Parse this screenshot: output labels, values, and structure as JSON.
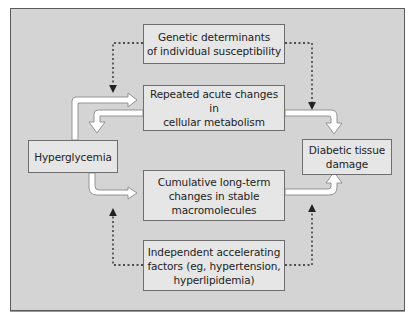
{
  "diagram": {
    "nodes": {
      "genetic": "Genetic determinants\nof individual susceptibility",
      "acute": "Repeated acute changes in\ncellular metabolism",
      "hyperglycemia": "Hyperglycemia",
      "damage": "Diabetic tissue\ndamage",
      "cumulative": "Cumulative long-term\nchanges in stable\nmacromolecules",
      "independent": "Independent accelerating\nfactors (eg, hypertension,\nhyperlipidemia)"
    },
    "edges": [
      {
        "from": "hyperglycemia",
        "to": "acute",
        "style": "hollow-arrow"
      },
      {
        "from": "acute",
        "to": "hyperglycemia",
        "style": "hollow-arrow"
      },
      {
        "from": "acute",
        "to": "damage",
        "style": "hollow-arrow"
      },
      {
        "from": "hyperglycemia",
        "to": "cumulative",
        "style": "hollow-arrow"
      },
      {
        "from": "cumulative",
        "to": "damage",
        "style": "hollow-arrow"
      },
      {
        "from": "genetic",
        "to": "acute",
        "style": "dotted"
      },
      {
        "from": "genetic",
        "to": "damage",
        "style": "dotted"
      },
      {
        "from": "independent",
        "to": "cumulative",
        "style": "dotted"
      },
      {
        "from": "independent",
        "to": "damage",
        "style": "dotted"
      }
    ],
    "colors": {
      "background": "#d4d4d4",
      "box_fill": "#e6e6e6",
      "box_border": "#6e6e6e",
      "arrow_fill": "#ffffff",
      "arrow_outline": "#8a8a8a",
      "dotted": "#222222"
    }
  }
}
